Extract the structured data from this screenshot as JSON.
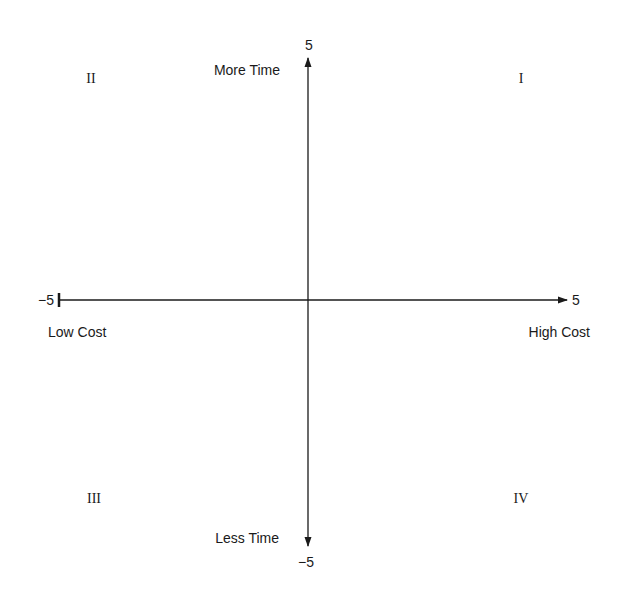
{
  "diagram": {
    "type": "quadrant",
    "x_axis": {
      "min_label": "−5",
      "max_label": "5",
      "min_caption": "Low Cost",
      "max_caption": "High Cost"
    },
    "y_axis": {
      "min_label": "−5",
      "max_label": "5",
      "min_caption": "Less Time",
      "max_caption": "More Time"
    },
    "quadrants": {
      "q1": "I",
      "q2": "II",
      "q3": "III",
      "q4": "IV"
    },
    "colors": {
      "axis": "#1a1a1a",
      "background": "#ffffff"
    }
  }
}
